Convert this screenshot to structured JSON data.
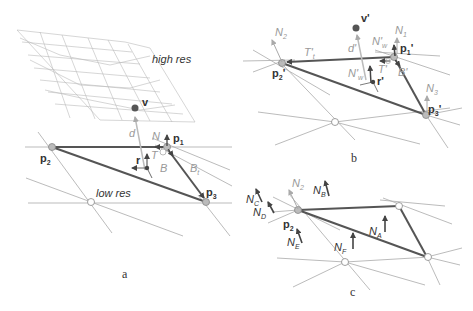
{
  "panels": {
    "a": {
      "caption": "a",
      "high_res_label": "high res",
      "low_res_label": "low res",
      "labels": {
        "v": "v",
        "p1": "p",
        "p1_sub": "1",
        "p2": "p",
        "p2_sub": "2",
        "p3": "p",
        "p3_sub": "3",
        "r": "r",
        "N": "N",
        "T": "T",
        "B": "B",
        "Bt": "B",
        "Bt_sub": "t",
        "d": "d"
      }
    },
    "b": {
      "caption": "b",
      "labels": {
        "v": "v'",
        "p1": "p",
        "p1_sub": "1",
        "p1_prime": "'",
        "p2": "p",
        "p2_sub": "2",
        "p2_prime": "'",
        "p3": "p",
        "p3_sub": "3",
        "p3_prime": "'",
        "r": "r'",
        "N1": "N",
        "N1_sub": "1",
        "N2": "N",
        "N2_sub": "2",
        "N3": "N",
        "N3_sub": "3",
        "Nw_top": "N'",
        "Nw_top_sub": "w",
        "Nw_r": "N'",
        "Nw_r_sub": "w",
        "Tt": "T'",
        "Tt_sub": "t",
        "T": "T'",
        "B": "B'",
        "d": "d'"
      }
    },
    "c": {
      "caption": "c",
      "labels": {
        "p2": "p",
        "p2_sub": "2",
        "N2": "N",
        "N2_sub": "2",
        "NA": "N",
        "NA_sub": "A",
        "NB": "N",
        "NB_sub": "B",
        "NC": "N",
        "NC_sub": "C",
        "ND": "N",
        "ND_sub": "D",
        "NE": "N",
        "NE_sub": "E",
        "NF": "N",
        "NF_sub": "F"
      }
    }
  },
  "colors": {
    "thin_line": "#aaaaaa",
    "thick_edge": "#555555",
    "vertex_fill": "#bbbbbb",
    "label": "#333333",
    "light_label": "#aaaaaa"
  }
}
